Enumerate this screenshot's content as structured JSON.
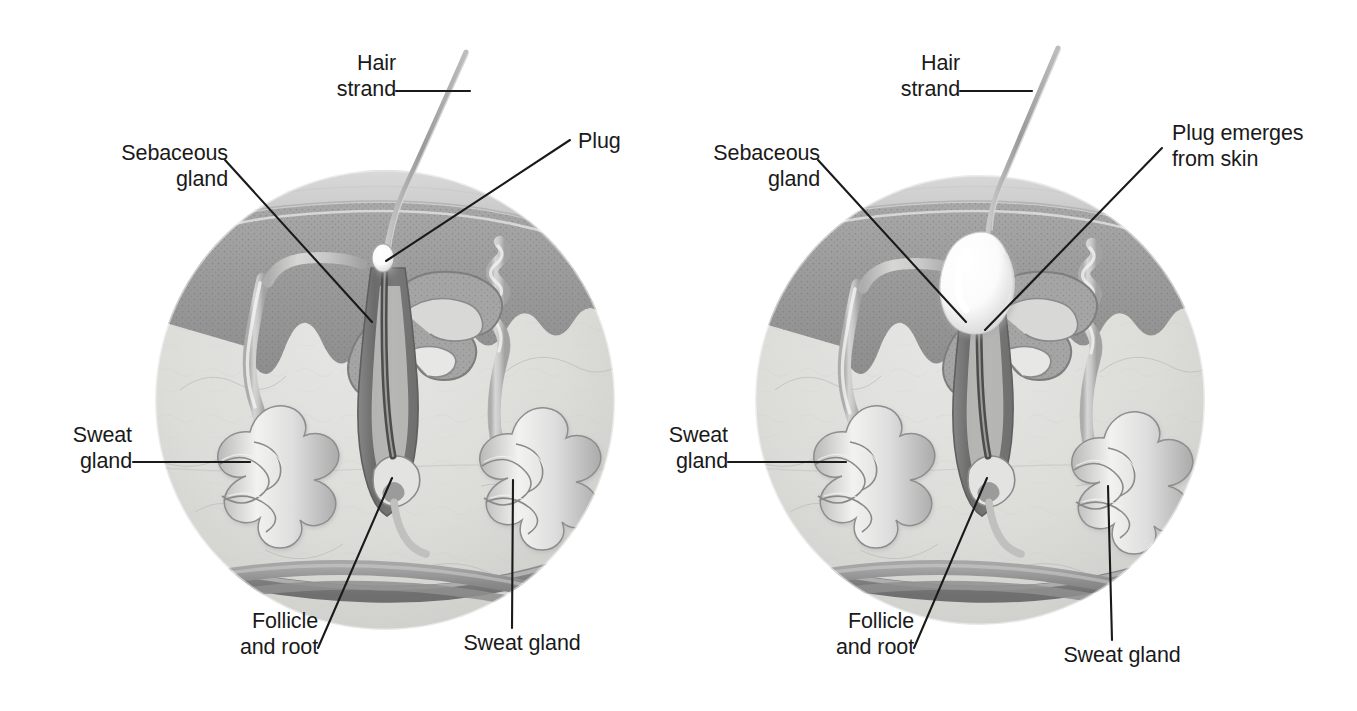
{
  "figure": {
    "type": "anatomical-diagram",
    "panels": [
      {
        "id": "left-panel",
        "name": "normal-follicle-panel",
        "labels": [
          {
            "key": "hair_strand",
            "text": "Hair\nstrand"
          },
          {
            "key": "sebaceous_gland",
            "text": "Sebaceous\ngland"
          },
          {
            "key": "plug",
            "text": "Plug"
          },
          {
            "key": "sweat_gland_left",
            "text": "Sweat\ngland"
          },
          {
            "key": "follicle_and_root",
            "text": "Follicle\nand root"
          },
          {
            "key": "sweat_gland_right",
            "text": "Sweat gland"
          }
        ]
      },
      {
        "id": "right-panel",
        "name": "plugged-follicle-panel",
        "labels": [
          {
            "key": "hair_strand",
            "text": "Hair\nstrand"
          },
          {
            "key": "sebaceous_gland",
            "text": "Sebaceous\ngland"
          },
          {
            "key": "plug_emerges",
            "text": "Plug emerges\nfrom skin"
          },
          {
            "key": "sweat_gland_left",
            "text": "Sweat\ngland"
          },
          {
            "key": "follicle_and_root",
            "text": "Follicle\nand root"
          },
          {
            "key": "sweat_gland_right",
            "text": "Sweat gland"
          }
        ]
      }
    ]
  },
  "left": {
    "hair_strand": "Hair\nstrand",
    "sebaceous_gland": "Sebaceous\ngland",
    "plug": "Plug",
    "sweat_gland_left": "Sweat\ngland",
    "follicle_and_root": "Follicle\nand root",
    "sweat_gland_right": "Sweat gland"
  },
  "right": {
    "hair_strand": "Hair\nstrand",
    "sebaceous_gland": "Sebaceous\ngland",
    "plug_emerges": "Plug emerges\nfrom skin",
    "sweat_gland_left": "Sweat\ngland",
    "follicle_and_root": "Follicle\nand root",
    "sweat_gland_right": "Sweat gland"
  },
  "colors": {
    "background": "#ffffff",
    "leader_line": "#1a1a1a",
    "text": "#1a1a1a",
    "skin_surface": "#d0d0d0",
    "epidermis": "#9a9a9a",
    "dermis": "#cfcfcf",
    "follicle_dark": "#6e6e6e",
    "gland_light": "#e2e2e2",
    "blood_vessel": "#8d8d8d",
    "plug_white": "#ffffff",
    "hair": "#a8a8a8"
  },
  "geometry": {
    "left_circle": {
      "cx": 385,
      "cy": 400,
      "r": 230
    },
    "right_circle": {
      "cx": 980,
      "cy": 400,
      "r": 225
    }
  }
}
